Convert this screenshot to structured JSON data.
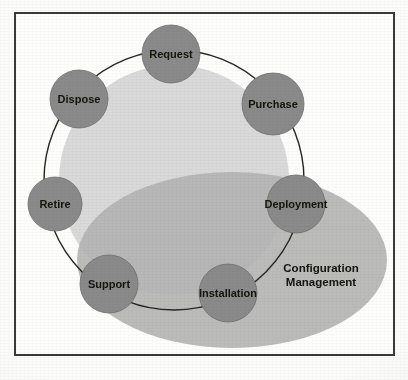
{
  "figure": {
    "name": "IT Asset Lifecycle with Configuration Management scope",
    "frame": {
      "border_color": "#3a3a3a"
    },
    "background_color": "#fdfdfc"
  },
  "palette": {
    "node_fill": "#8a8a8a",
    "node_edge": "#6f6f6f",
    "lifecycle_circle_fill": "#d9d9d9",
    "config_ellipse_fill": "#b2b2b2",
    "ring_stroke": "#26261f",
    "label_text": "#14140f"
  },
  "regions": [
    {
      "id": "lifecycle-circle",
      "label": "",
      "shape": "circle",
      "fill": "#d9d9d9",
      "cx": 174,
      "cy": 180,
      "r": 115
    },
    {
      "id": "configuration-management-ellipse",
      "label": "Configuration Management",
      "label_lines": [
        "Configuration",
        "Management"
      ],
      "shape": "ellipse",
      "fill": "#b2b2b2",
      "cx": 232,
      "cy": 260,
      "rx": 155,
      "ry": 88,
      "label_x": 321,
      "label_y": 272
    }
  ],
  "lifecycle_ring": {
    "id": "lifecycle-ring",
    "shape": "circle-outline",
    "stroke": "#26261f",
    "stroke_width": 1.4,
    "cx": 174,
    "cy": 180,
    "r": 130
  },
  "nodes": [
    {
      "id": "request",
      "label": "Request",
      "cx": 171,
      "cy": 54,
      "r": 29,
      "label_dx": 0,
      "label_dy": 4
    },
    {
      "id": "purchase",
      "label": "Purchase",
      "cx": 273,
      "cy": 104,
      "r": 31,
      "label_dx": 0,
      "label_dy": 4
    },
    {
      "id": "deployment",
      "label": "Deployment",
      "cx": 296,
      "cy": 204,
      "r": 29,
      "label_dx": 0,
      "label_dy": 4
    },
    {
      "id": "installation",
      "label": "Installation",
      "cx": 228,
      "cy": 293,
      "r": 29,
      "label_dx": 0,
      "label_dy": 4
    },
    {
      "id": "support",
      "label": "Support",
      "cx": 109,
      "cy": 284,
      "r": 29,
      "label_dx": 0,
      "label_dy": 4
    },
    {
      "id": "retire",
      "label": "Retire",
      "cx": 55,
      "cy": 204,
      "r": 27,
      "label_dx": 0,
      "label_dy": 4
    },
    {
      "id": "dispose",
      "label": "Dispose",
      "cx": 79,
      "cy": 99,
      "r": 29,
      "label_dx": 0,
      "label_dy": 4
    },
    {
      "id": "blank_node",
      "label": "",
      "cx": 0,
      "cy": 0,
      "r": 0,
      "label_dx": 0,
      "label_dy": 0
    }
  ],
  "node_order": [
    "Request",
    "Purchase",
    "Deployment",
    "Installation",
    "Support",
    "Retire",
    "Dispose"
  ]
}
